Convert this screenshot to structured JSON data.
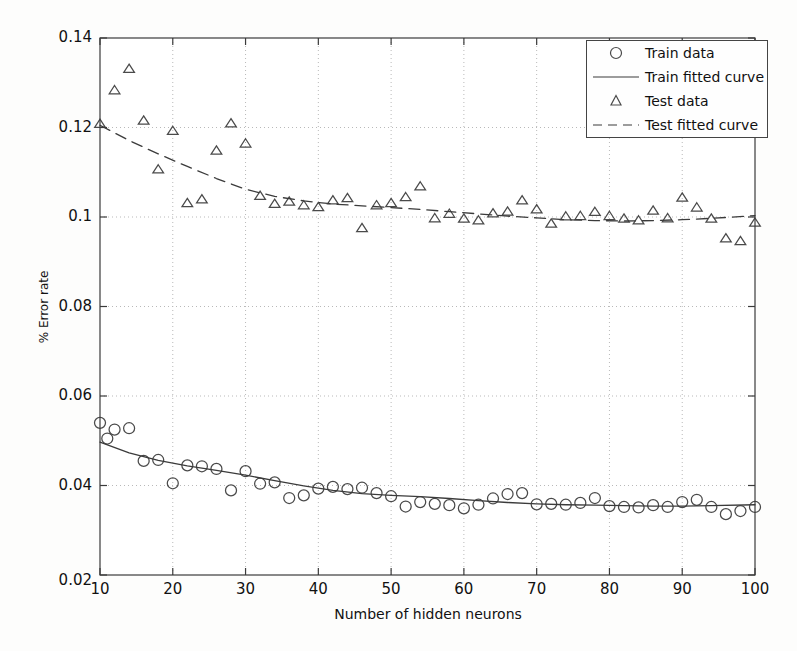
{
  "chart_data": {
    "type": "scatter",
    "title": "",
    "xlabel": "Number of hidden neurons",
    "ylabel": "% Error rate",
    "xlim": [
      10,
      100
    ],
    "ylim": [
      0.02,
      0.14
    ],
    "xticks": [
      10,
      20,
      30,
      40,
      50,
      60,
      70,
      80,
      90,
      100
    ],
    "yticks": [
      0.02,
      0.04,
      0.06,
      0.08,
      0.1,
      0.12,
      0.14
    ],
    "ytick_labels": [
      "0.02",
      "0.04",
      "0.06",
      "0.08",
      "0.1",
      "0.12",
      "0.14"
    ],
    "xtick_labels": [
      "10",
      "20",
      "30",
      "40",
      "50",
      "60",
      "70",
      "80",
      "90",
      "100"
    ],
    "grid": true,
    "grid_style": "dotted",
    "legend_position": "upper right",
    "series": [
      {
        "name": "Train data",
        "marker": "circle",
        "style": "markers",
        "x": [
          10,
          11,
          12,
          14,
          16,
          18,
          20,
          22,
          24,
          26,
          28,
          30,
          32,
          34,
          36,
          38,
          40,
          42,
          44,
          46,
          48,
          50,
          52,
          54,
          56,
          58,
          60,
          62,
          64,
          66,
          68,
          70,
          72,
          74,
          76,
          78,
          80,
          82,
          84,
          86,
          88,
          90,
          92,
          94,
          96,
          98,
          100
        ],
        "y": [
          0.054,
          0.0505,
          0.0525,
          0.0528,
          0.0455,
          0.0457,
          0.0405,
          0.0445,
          0.0443,
          0.0437,
          0.0389,
          0.0432,
          0.0404,
          0.0407,
          0.0372,
          0.0378,
          0.0393,
          0.0397,
          0.0392,
          0.0395,
          0.0383,
          0.0376,
          0.0353,
          0.0363,
          0.0359,
          0.0356,
          0.0349,
          0.0357,
          0.0371,
          0.0381,
          0.0383,
          0.0358,
          0.0359,
          0.0357,
          0.0361,
          0.0372,
          0.0354,
          0.0352,
          0.0351,
          0.0356,
          0.0352,
          0.0363,
          0.0368,
          0.0352,
          0.0336,
          0.0343,
          0.0352
        ]
      },
      {
        "name": "Train fitted curve",
        "marker": "none",
        "style": "solid-line",
        "x": [
          10,
          14,
          18,
          22,
          26,
          30,
          34,
          38,
          42,
          46,
          50,
          54,
          58,
          62,
          66,
          70,
          74,
          78,
          82,
          86,
          90,
          94,
          100
        ],
        "y": [
          0.0497,
          0.0473,
          0.0456,
          0.0444,
          0.0434,
          0.0423,
          0.0411,
          0.0399,
          0.0389,
          0.0382,
          0.0378,
          0.0375,
          0.0371,
          0.0366,
          0.0362,
          0.0359,
          0.0357,
          0.0356,
          0.0355,
          0.0354,
          0.0354,
          0.0355,
          0.0357
        ]
      },
      {
        "name": "Test data",
        "marker": "triangle",
        "style": "markers",
        "x": [
          10,
          12,
          14,
          16,
          18,
          20,
          22,
          24,
          26,
          28,
          30,
          32,
          34,
          36,
          38,
          40,
          42,
          44,
          46,
          48,
          50,
          52,
          54,
          56,
          58,
          60,
          62,
          64,
          66,
          68,
          70,
          72,
          74,
          76,
          78,
          80,
          82,
          84,
          86,
          88,
          90,
          92,
          94,
          96,
          98,
          100
        ],
        "y": [
          0.1208,
          0.1283,
          0.1331,
          0.1215,
          0.1106,
          0.1192,
          0.1031,
          0.1039,
          0.1148,
          0.1209,
          0.1164,
          0.1047,
          0.1029,
          0.1034,
          0.1026,
          0.1022,
          0.1037,
          0.1042,
          0.0975,
          0.1026,
          0.1031,
          0.1044,
          0.1068,
          0.0997,
          0.1007,
          0.0996,
          0.0992,
          0.1008,
          0.1012,
          0.1037,
          0.1017,
          0.0985,
          0.1001,
          0.1002,
          0.1011,
          0.1002,
          0.0996,
          0.0992,
          0.1014,
          0.0997,
          0.1043,
          0.1021,
          0.0996,
          0.0952,
          0.0946,
          0.0987
        ]
      },
      {
        "name": "Test fitted curve",
        "marker": "none",
        "style": "dashed-line",
        "x": [
          10,
          14,
          18,
          22,
          26,
          30,
          34,
          38,
          42,
          46,
          50,
          54,
          58,
          62,
          66,
          70,
          74,
          78,
          82,
          86,
          90,
          94,
          100
        ],
        "y": [
          0.1205,
          0.1171,
          0.1141,
          0.1113,
          0.1086,
          0.1062,
          0.1046,
          0.1036,
          0.1029,
          0.1025,
          0.1021,
          0.1017,
          0.1012,
          0.1007,
          0.1002,
          0.0998,
          0.0994,
          0.0992,
          0.0991,
          0.0992,
          0.0994,
          0.0997,
          0.1003
        ]
      }
    ]
  },
  "legend": {
    "items": [
      {
        "label": "Train data",
        "symbol": "circle"
      },
      {
        "label": "Train fitted curve",
        "symbol": "solid-line"
      },
      {
        "label": "Test data",
        "symbol": "triangle"
      },
      {
        "label": "Test fitted curve",
        "symbol": "dashed-line"
      }
    ]
  },
  "colors": {
    "axis": "#3b3b3b",
    "grid": "#b9b9b9",
    "marker": "#4a4a4a",
    "curve": "#3b3b3b",
    "background": "#fdfdfc"
  }
}
